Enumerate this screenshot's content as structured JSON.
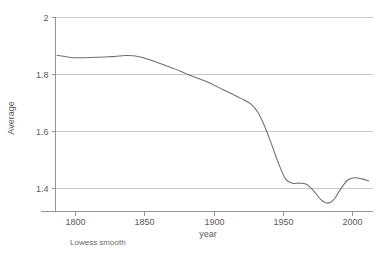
{
  "chart_data": {
    "type": "line",
    "title": "",
    "subtitle": "",
    "xlabel": "year",
    "ylabel": "Average",
    "annotation": "Lowess smooth",
    "grid": "horizontal",
    "legend": "none",
    "xlim": [
      1787,
      2015
    ],
    "ylim": [
      1.33,
      2.0
    ],
    "xticks": [
      1800,
      1850,
      1900,
      1950,
      2000
    ],
    "xtick_labels": [
      "1800",
      "1850",
      "1900",
      "1950",
      "2000"
    ],
    "yticks": [
      1.4,
      1.6,
      1.8,
      2.0
    ],
    "ytick_labels": [
      "1.4",
      "1.6",
      "1.8",
      "2"
    ],
    "series": [
      {
        "name": "Lowess smooth",
        "color": "#6e6e6e",
        "x": [
          1787,
          1792,
          1797,
          1802,
          1807,
          1812,
          1817,
          1822,
          1827,
          1832,
          1837,
          1842,
          1847,
          1852,
          1857,
          1862,
          1867,
          1872,
          1877,
          1882,
          1887,
          1892,
          1897,
          1902,
          1907,
          1912,
          1917,
          1922,
          1927,
          1932,
          1937,
          1942,
          1947,
          1952,
          1957,
          1962,
          1967,
          1972,
          1977,
          1982,
          1987,
          1992,
          1997,
          2002,
          2007,
          2012
        ],
        "y": [
          1.866,
          1.862,
          1.858,
          1.857,
          1.857,
          1.858,
          1.859,
          1.86,
          1.861,
          1.863,
          1.865,
          1.864,
          1.86,
          1.853,
          1.845,
          1.836,
          1.827,
          1.818,
          1.808,
          1.797,
          1.788,
          1.779,
          1.769,
          1.757,
          1.745,
          1.733,
          1.721,
          1.709,
          1.694,
          1.666,
          1.616,
          1.552,
          1.486,
          1.432,
          1.417,
          1.417,
          1.413,
          1.392,
          1.362,
          1.347,
          1.36,
          1.398,
          1.428,
          1.436,
          1.432,
          1.425
        ]
      }
    ]
  },
  "labels": {
    "ylabel": "Average",
    "xlabel": "year",
    "caption": "Lowess smooth"
  }
}
